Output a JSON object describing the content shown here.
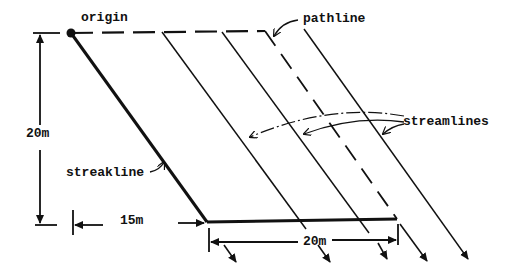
{
  "diagram": {
    "labels": {
      "origin": "origin",
      "pathline": "pathline",
      "streamlines": "streamlines",
      "streakline": "streakline",
      "height_dim": "20m",
      "offset_dim": "15m",
      "width_dim": "20m"
    },
    "colors": {
      "ink": "#111111",
      "background": "#ffffff"
    },
    "geometry": {
      "origin_point": [
        71,
        33
      ],
      "pathline_corner": [
        265,
        31
      ],
      "streakline_end": [
        207,
        222
      ],
      "pathline_end": [
        397,
        219
      ],
      "streamline_starts": [
        [
          162,
          32
        ],
        [
          222,
          32
        ],
        [
          304,
          29
        ]
      ]
    }
  }
}
